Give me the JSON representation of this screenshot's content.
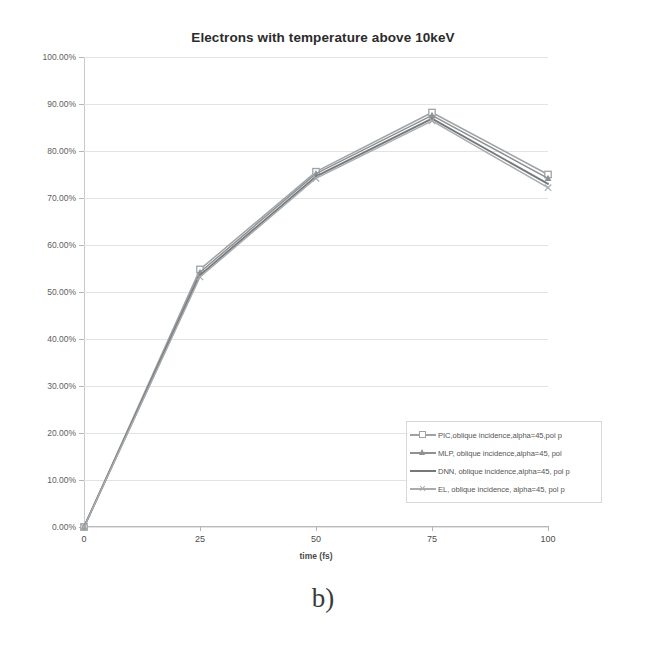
{
  "figure": {
    "caption": "b)"
  },
  "chart_data": {
    "type": "line",
    "title": "Electrons with temperature above 10keV",
    "xlabel": "time (fs)",
    "ylabel": "",
    "x": [
      0,
      25,
      50,
      75,
      100
    ],
    "xticklabels": [
      "0",
      "25",
      "50",
      "75",
      "100"
    ],
    "yticklabels": [
      "0.00%",
      "10.00%",
      "20.00%",
      "30.00%",
      "40.00%",
      "50.00%",
      "60.00%",
      "70.00%",
      "80.00%",
      "90.00%",
      "100.00%"
    ],
    "ytickvalues": [
      0,
      10,
      20,
      30,
      40,
      50,
      60,
      70,
      80,
      90,
      100
    ],
    "xlim": [
      0,
      100
    ],
    "ylim": [
      0,
      100
    ],
    "grid": true,
    "legend_position": "inside-lower-right",
    "series": [
      {
        "name": "PIC,oblique incidence,alpha=45,pol p",
        "values": [
          0.0,
          54.8,
          75.6,
          88.2,
          75.0
        ],
        "color": "#9fa3a6",
        "marker": "square-open"
      },
      {
        "name": "MLP, oblique incidence,alpha=45, pol",
        "values": [
          0.0,
          54.2,
          75.2,
          87.6,
          74.2
        ],
        "color": "#8d9194",
        "marker": "triangle"
      },
      {
        "name": "DNN, oblique incidence,alpha=45, pol p",
        "values": [
          0.0,
          53.6,
          74.6,
          86.9,
          73.0
        ],
        "color": "#76797c",
        "marker": "none"
      },
      {
        "name": "EL, oblique incidence, alpha=45, pol p",
        "values": [
          0.0,
          53.2,
          74.2,
          86.4,
          72.2
        ],
        "color": "#a8acae",
        "marker": "x"
      }
    ]
  }
}
